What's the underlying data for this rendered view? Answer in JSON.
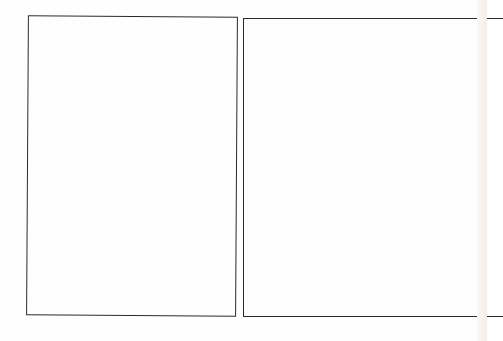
{
  "page": {
    "type": "scanned comic/storyboard page",
    "background_color": "#fefefe",
    "edge_tint_color": "#f3efe6",
    "border_color": "#2b2b2b"
  },
  "panels": [
    {
      "id": "left",
      "content": ""
    },
    {
      "id": "right",
      "content": ""
    }
  ]
}
